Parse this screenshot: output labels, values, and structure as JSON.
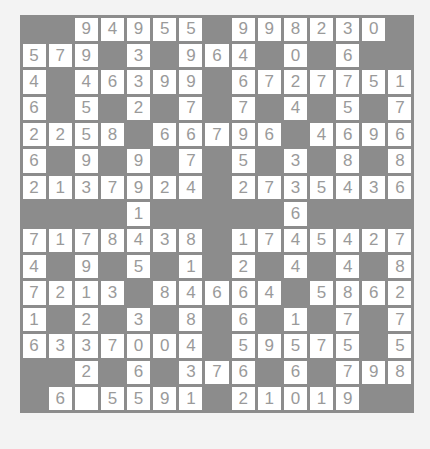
{
  "puzzle": {
    "rows": 15,
    "cols": 15,
    "colors": {
      "page_background": "#f3f3f3",
      "block": "#8c8c8c",
      "cell": "#ffffff",
      "digit": "#9a9a9a"
    },
    "grid": [
      [
        "#",
        "#",
        "9",
        "4",
        "9",
        "5",
        "5",
        "#",
        "9",
        "9",
        "8",
        "2",
        "3",
        "0",
        "#"
      ],
      [
        "5",
        "7",
        "9",
        "#",
        "3",
        "#",
        "9",
        "6",
        "4",
        "#",
        "0",
        "#",
        "6",
        "#",
        "#"
      ],
      [
        "4",
        "#",
        "4",
        "6",
        "3",
        "9",
        "9",
        "#",
        "6",
        "7",
        "2",
        "7",
        "7",
        "5",
        "1"
      ],
      [
        "6",
        "#",
        "5",
        "#",
        "2",
        "#",
        "7",
        "#",
        "7",
        "#",
        "4",
        "#",
        "5",
        "#",
        "7"
      ],
      [
        "2",
        "2",
        "5",
        "8",
        "#",
        "6",
        "6",
        "7",
        "9",
        "6",
        "#",
        "4",
        "6",
        "9",
        "6"
      ],
      [
        "6",
        "#",
        "9",
        "#",
        "9",
        "#",
        "7",
        "#",
        "5",
        "#",
        "3",
        "#",
        "8",
        "#",
        "8"
      ],
      [
        "2",
        "1",
        "3",
        "7",
        "9",
        "2",
        "4",
        "#",
        "2",
        "7",
        "3",
        "5",
        "4",
        "3",
        "6"
      ],
      [
        "#",
        "#",
        "#",
        "#",
        "1",
        "#",
        "#",
        "#",
        "#",
        "#",
        "6",
        "#",
        "#",
        "#",
        "#"
      ],
      [
        "7",
        "1",
        "7",
        "8",
        "4",
        "3",
        "8",
        "#",
        "1",
        "7",
        "4",
        "5",
        "4",
        "2",
        "7"
      ],
      [
        "4",
        "#",
        "9",
        "#",
        "5",
        "#",
        "1",
        "#",
        "2",
        "#",
        "4",
        "#",
        "4",
        "#",
        "8"
      ],
      [
        "7",
        "2",
        "1",
        "3",
        "#",
        "8",
        "4",
        "6",
        "6",
        "4",
        "#",
        "5",
        "8",
        "6",
        "2"
      ],
      [
        "1",
        "#",
        "2",
        "#",
        "3",
        "#",
        "8",
        "#",
        "6",
        "#",
        "1",
        "#",
        "7",
        "#",
        "7"
      ],
      [
        "6",
        "3",
        "3",
        "7",
        "0",
        "0",
        "4",
        "#",
        "5",
        "9",
        "5",
        "7",
        "5",
        "#",
        "5"
      ],
      [
        "#",
        "#",
        "2",
        "#",
        "6",
        "#",
        "3",
        "7",
        "6",
        "#",
        "6",
        "#",
        "7",
        "9",
        "8"
      ],
      [
        "#",
        "6",
        "",
        "5",
        "5",
        "9",
        "1",
        "#",
        "2",
        "1",
        "0",
        "1",
        "9",
        "#",
        "#"
      ]
    ]
  }
}
